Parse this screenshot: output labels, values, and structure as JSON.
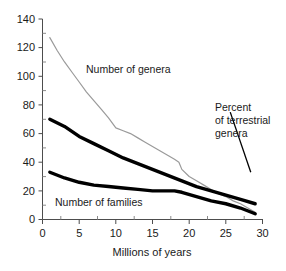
{
  "chart_data": {
    "type": "line",
    "title": "",
    "subtitle": "",
    "xlabel": "Millions of years",
    "ylabel": "",
    "xlim": [
      0,
      30
    ],
    "ylim": [
      0,
      140
    ],
    "xticks": [
      0,
      5,
      10,
      15,
      20,
      25,
      30
    ],
    "yticks": [
      0,
      20,
      40,
      60,
      80,
      100,
      120,
      140
    ],
    "xtick_labels": [
      "0",
      "5",
      "10",
      "15",
      "20",
      "25",
      "30"
    ],
    "ytick_labels": [
      "0",
      "20",
      "40",
      "60",
      "80",
      "100",
      "120",
      "140"
    ],
    "grid": false,
    "legend_position": "inline-annotations",
    "series": [
      {
        "name": "Number of genera",
        "style": "thin-gray",
        "color": "#9a9a9a",
        "x": [
          1,
          2,
          3,
          4,
          5,
          6,
          7,
          8,
          9,
          10,
          11,
          12,
          13,
          14,
          15,
          16,
          17,
          18,
          18.6,
          19,
          20,
          21,
          22,
          23,
          24,
          25,
          26,
          27,
          28,
          29
        ],
        "y": [
          127,
          118,
          110,
          103,
          96,
          89,
          83,
          77,
          71,
          64,
          62,
          60,
          57,
          54,
          51,
          48,
          45,
          42,
          40,
          35,
          30,
          27,
          24,
          21,
          18,
          16,
          13,
          11,
          8,
          5
        ]
      },
      {
        "name": "Percent of terrestrial genera",
        "style": "thick-black",
        "color": "#000000",
        "x": [
          1,
          3,
          5,
          7,
          9,
          11,
          13,
          15,
          17,
          19,
          21,
          23,
          25,
          27,
          29
        ],
        "y": [
          70,
          65,
          58,
          53,
          48,
          43,
          39,
          35,
          31,
          27,
          23,
          20,
          17,
          14,
          11
        ]
      },
      {
        "name": "Number of families",
        "style": "thick-black",
        "color": "#000000",
        "x": [
          1,
          3,
          5,
          7,
          9,
          11,
          13,
          15,
          17,
          18,
          19,
          21,
          23,
          25,
          27,
          29
        ],
        "y": [
          33,
          29,
          26,
          24,
          23,
          22,
          21,
          20,
          20,
          20,
          19,
          16,
          13,
          11,
          8,
          4
        ]
      }
    ],
    "annotations": [
      {
        "text": "Number of genera",
        "x": 7.0,
        "y": 98
      },
      {
        "text": "Number of families",
        "x": 2.2,
        "y": 12
      },
      {
        "text": "Percent",
        "x": 23.6,
        "y": 106
      },
      {
        "text": "of terrestrial",
        "x": 23.6,
        "y": 95
      },
      {
        "text": "genera",
        "x": 23.6,
        "y": 84
      }
    ],
    "leader_line": {
      "x1": 25.6,
      "y1": 75,
      "x2": 28.4,
      "y2": 33
    }
  },
  "labels": {
    "xaxis_title": "Millions of years",
    "genera": "Number of genera",
    "families": "Number of families",
    "percent_line1": "Percent",
    "percent_line2": "of terrestrial",
    "percent_line3": "genera"
  },
  "ytick": {
    "t0": "0",
    "t1": "20",
    "t2": "40",
    "t3": "60",
    "t4": "80",
    "t5": "100",
    "t6": "120",
    "t7": "140"
  },
  "xtick": {
    "t0": "0",
    "t1": "5",
    "t2": "10",
    "t3": "15",
    "t4": "20",
    "t5": "25",
    "t6": "30"
  },
  "colors": {
    "thin_line": "#9a9a9a",
    "thick_line": "#000000",
    "axis": "#4d4d4d",
    "text": "#1a1a1a",
    "background": "#ffffff"
  }
}
